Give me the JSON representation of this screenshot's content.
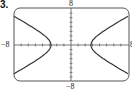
{
  "problem_number": "3.",
  "chart_data": {
    "type": "line",
    "title": "",
    "equation_estimate": "x^2/9 - y^2/5.5 = 1",
    "xlim": [
      -8,
      8
    ],
    "ylim": [
      -8,
      8
    ],
    "x_tick_step": 1,
    "y_tick_step": 1,
    "grid": false,
    "tick_labels": {
      "x_min": "−8",
      "x_max": "8",
      "y_min": "−8",
      "y_max": "8"
    },
    "series": [
      {
        "name": "left branch",
        "points": [
          [
            -8,
            5.8
          ],
          [
            -6,
            4.1
          ],
          [
            -4,
            2.1
          ],
          [
            -3,
            0
          ],
          [
            -4,
            -2.1
          ],
          [
            -6,
            -4.1
          ],
          [
            -8,
            -5.8
          ]
        ]
      },
      {
        "name": "right branch",
        "points": [
          [
            8,
            5.8
          ],
          [
            6,
            4.1
          ],
          [
            4,
            2.1
          ],
          [
            3,
            0
          ],
          [
            4,
            -2.1
          ],
          [
            6,
            -4.1
          ],
          [
            8,
            -5.8
          ]
        ]
      }
    ],
    "colors": {
      "curve": "#333333",
      "axes": "#444444",
      "frame": "#555555"
    }
  }
}
